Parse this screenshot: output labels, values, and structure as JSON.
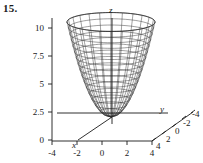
{
  "problem": {
    "number": "15."
  },
  "chart_data": {
    "type": "line",
    "title": "",
    "subtitle": "",
    "plot_kind": "3d-wireframe-surface",
    "surface": "elliptic paraboloid z = x^2 + y^2",
    "axes": {
      "x": {
        "label": "x",
        "ticks": []
      },
      "y": {
        "label": "y",
        "ticks": [
          4,
          2,
          0,
          -2,
          -4
        ],
        "range": [
          -4,
          4
        ]
      },
      "z": {
        "label": "z",
        "ticks": [
          0,
          2.5,
          5,
          7.5,
          10
        ],
        "range": [
          0,
          10
        ]
      }
    },
    "horizontal_axis_ticks": [
      -4,
      -2,
      0,
      2,
      4
    ],
    "depth_axis_ticks": [
      4,
      2,
      0,
      -2,
      -4
    ],
    "z_axis_ticks": [
      "10",
      "7.5",
      "5",
      "2.5",
      "0"
    ],
    "mesh": {
      "radial_lines": 24,
      "rings": 16
    },
    "grid": false,
    "legend": "none"
  },
  "labels": {
    "z": "z",
    "y": "y",
    "x": "x"
  },
  "ticks": {
    "z": [
      "10",
      "7.5",
      "5",
      "2.5",
      "0"
    ],
    "bottom": [
      "-4",
      "-2",
      "0",
      "2",
      "4"
    ],
    "depth": [
      "4",
      "2",
      "0",
      "-2",
      "-4"
    ]
  },
  "colors": {
    "ink": "#1a1a1a",
    "mesh": "#2b2b2b",
    "background": "#ffffff"
  }
}
